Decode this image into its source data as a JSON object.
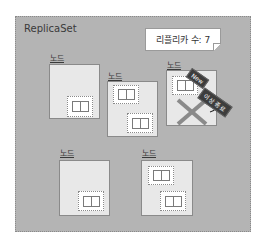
{
  "replicaset": {
    "title": "ReplicaSet",
    "replica_count_label": "리플리카 수: 7"
  },
  "nodes": [
    {
      "label": "노드",
      "pods": 1
    },
    {
      "label": "노드",
      "pods": 2
    },
    {
      "label": "노드",
      "pods": 1,
      "status": "failed"
    },
    {
      "label": "노드",
      "pods": 1
    },
    {
      "label": "노드",
      "pods": 2
    }
  ],
  "tags": {
    "new": "New",
    "abnormal_exit": "이상 종료"
  },
  "colors": {
    "background": "#b4b4b4",
    "node_fill": "#e8e8e8",
    "failed_x": "#8a8a8a",
    "tag_fill": "#3d3d3d"
  }
}
